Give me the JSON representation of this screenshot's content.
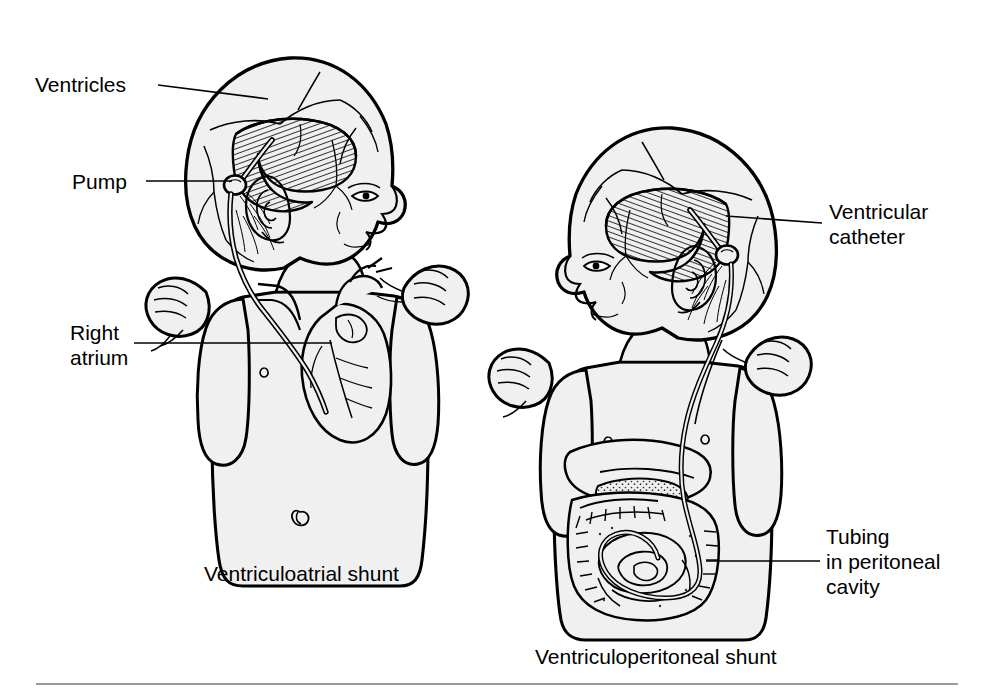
{
  "figure": {
    "domain": "medical-illustration",
    "title_hidden": "",
    "background_color": "#ffffff",
    "line_color": "#000000",
    "skin_fill_color": "#f0f0f0",
    "rule_color": "#9a9a9a"
  },
  "labels": {
    "ventricles": "Ventricles",
    "pump": "Pump",
    "right_atrium": "Right\natrium",
    "ventricular_catheter": "Ventricular\ncatheter",
    "tubing_peritoneal": "Tubing\nin peritoneal\ncavity"
  },
  "captions": {
    "left": "Ventriculoatrial shunt",
    "right": "Ventriculoperitoneal shunt"
  },
  "panels": [
    {
      "name": "ventriculoatrial",
      "caption": "Ventriculoatrial shunt",
      "facing": "right",
      "labels": [
        "Ventricles",
        "Pump",
        "Right atrium"
      ],
      "anatomy": [
        "enlarged-head",
        "lateral-ventricle",
        "ear",
        "torso",
        "heart",
        "great-vessels",
        "fists"
      ],
      "device": [
        "ventricular-catheter",
        "pump-reservoir",
        "distal-tubing-to-right-atrium"
      ]
    },
    {
      "name": "ventriculoperitoneal",
      "caption": "Ventriculoperitoneal shunt",
      "facing": "left",
      "labels": [
        "Ventricular catheter",
        "Tubing in peritoneal cavity"
      ],
      "anatomy": [
        "enlarged-head",
        "lateral-ventricle",
        "ear",
        "torso",
        "liver",
        "stomach",
        "colon",
        "small-intestine",
        "fists"
      ],
      "device": [
        "ventricular-catheter",
        "pump-reservoir",
        "distal-tubing-coiled-in-peritoneum"
      ]
    }
  ],
  "leader_lines": [
    {
      "label": "Ventricles",
      "from": [
        158,
        85
      ],
      "to": [
        268,
        98
      ]
    },
    {
      "label": "Pump",
      "from": [
        145,
        182
      ],
      "to": [
        231,
        182
      ]
    },
    {
      "label": "Right atrium",
      "from": [
        133,
        343
      ],
      "to": [
        330,
        343
      ]
    },
    {
      "label": "Ventricular catheter",
      "from": [
        822,
        223
      ],
      "to": [
        727,
        217
      ]
    },
    {
      "label": "Tubing in peritoneal cavity",
      "from": [
        820,
        561
      ],
      "to": [
        708,
        561
      ]
    }
  ],
  "footer_rule": {
    "x1": 36,
    "x2": 958,
    "y": 684
  }
}
